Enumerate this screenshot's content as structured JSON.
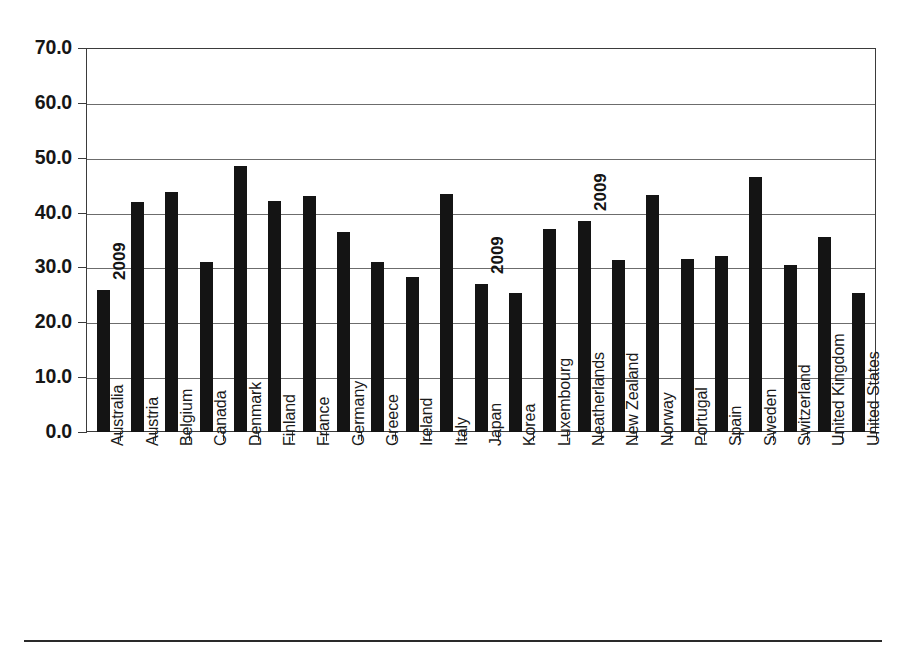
{
  "figure": {
    "top_caption": "",
    "bottom_rule": true
  },
  "chart_data": {
    "type": "bar",
    "title": "",
    "subtitle": "",
    "xlabel": "",
    "ylabel": "",
    "ylim": [
      0.0,
      70.0
    ],
    "ytick_labels": [
      "70.0",
      "60.0",
      "50.0",
      "40.0",
      "30.0",
      "20.0",
      "10.0",
      "0.0"
    ],
    "ytick_values": [
      70.0,
      60.0,
      50.0,
      40.0,
      30.0,
      20.0,
      10.0,
      0.0
    ],
    "grid": true,
    "grid_axis": "y",
    "legend": false,
    "bar_color": "#141414",
    "categories": [
      "Australia",
      "Austria",
      "Belgium",
      "Canada",
      "Denmark",
      "Finland",
      "France",
      "Germany",
      "Greece",
      "Ireland",
      "Italy",
      "Japan",
      "Korea",
      "Luxembourg",
      "Neatherlands",
      "New Zealand",
      "Norway",
      "Portugal",
      "Spain",
      "Sweden",
      "Switzerland",
      "United Kingdom",
      "United States"
    ],
    "values": [
      25.9,
      41.9,
      43.8,
      30.9,
      48.4,
      42.2,
      43.0,
      36.5,
      30.9,
      28.2,
      43.3,
      27.0,
      25.4,
      37.0,
      38.5,
      31.4,
      43.2,
      31.5,
      32.1,
      46.4,
      30.4,
      35.6,
      25.4
    ],
    "annotations": [
      {
        "text": "2009",
        "category": "Australia",
        "rotation": -90
      },
      {
        "text": "2009",
        "category": "Japan",
        "rotation": -90
      },
      {
        "text": "2009",
        "category": "Neatherlands",
        "rotation": -90
      }
    ]
  }
}
